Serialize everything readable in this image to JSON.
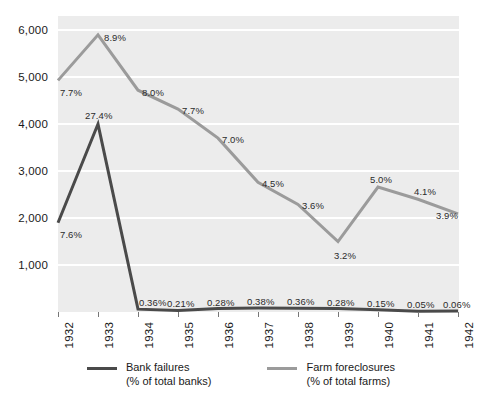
{
  "chart_data": {
    "type": "line",
    "title": "",
    "subtitle": "",
    "xlabel": "",
    "ylabel": "",
    "categories": [
      "1932",
      "1933",
      "1934",
      "1935",
      "1936",
      "1937",
      "1938",
      "1939",
      "1940",
      "1941",
      "1942"
    ],
    "ylim": [
      0,
      6300
    ],
    "yticks": [
      1000,
      2000,
      3000,
      4000,
      5000,
      6000
    ],
    "ytick_labels": [
      "1,000",
      "2,000",
      "3,000",
      "4,000",
      "5,000",
      "6,000"
    ],
    "grid": true,
    "legend_position": "bottom",
    "series": [
      {
        "name": "Bank failures",
        "sublabel": "(% of total banks)",
        "color": "#4a4a4a",
        "values": [
          1900,
          4000,
          61,
          32,
          72,
          84,
          81,
          72,
          48,
          17,
          23
        ],
        "point_labels": [
          "7.6%",
          "27.4%",
          "0.36%",
          "0.21%",
          "0.28%",
          "0.38%",
          "0.36%",
          "0.28%",
          "0.15%",
          "0.05%",
          "0.06%"
        ]
      },
      {
        "name": "Farm foreclosures",
        "sublabel": "(% of total farms)",
        "color": "#9b9b9b",
        "values": [
          4930,
          5900,
          4720,
          4320,
          3700,
          2760,
          2290,
          1500,
          2660,
          2400,
          2090
        ],
        "point_labels": [
          "7.7%",
          "8.9%",
          "8.0%",
          "7.7%",
          "7.0%",
          "4.5%",
          "3.6%",
          "3.2%",
          "5.0%",
          "4.1%",
          "3.9%"
        ]
      }
    ]
  },
  "legend": {
    "items": [
      {
        "label": "Bank failures",
        "sublabel": "(% of total banks)",
        "color": "#4a4a4a"
      },
      {
        "label": "Farm foreclosures",
        "sublabel": "(% of total farms)",
        "color": "#9b9b9b"
      }
    ]
  },
  "colors": {
    "plot_background": "#ececec",
    "gridline": "#ffffff",
    "page_background": "#ffffff",
    "text": "#1a1a1a",
    "bank_failures": "#4a4a4a",
    "farm_foreclosures": "#9b9b9b"
  }
}
